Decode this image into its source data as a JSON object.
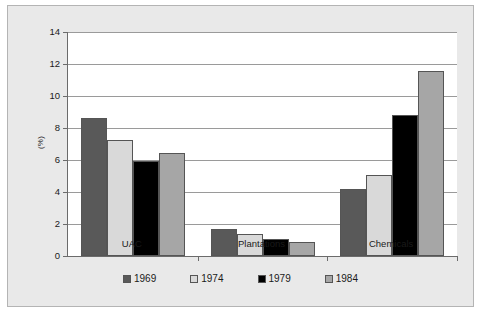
{
  "chart_data": {
    "type": "bar",
    "title": "",
    "xlabel": "",
    "ylabel": "(%)",
    "ylim": [
      0,
      14
    ],
    "yticks": [
      0,
      2,
      4,
      6,
      8,
      10,
      12,
      14
    ],
    "grid": true,
    "legend_position": "bottom",
    "categories": [
      "UAC",
      "Plantations",
      "Chemicals"
    ],
    "series": [
      {
        "name": "1969",
        "color": "#595959",
        "values": [
          8.6,
          1.7,
          4.2
        ]
      },
      {
        "name": "1974",
        "color": "#d9d9d9",
        "values": [
          7.25,
          1.35,
          5.05
        ]
      },
      {
        "name": "1979",
        "color": "#000000",
        "values": [
          5.95,
          1.05,
          8.8
        ]
      },
      {
        "name": "1984",
        "color": "#a6a6a6",
        "values": [
          6.45,
          0.9,
          11.55
        ]
      }
    ]
  },
  "axis": {
    "y_title": "(%)",
    "tick_labels": [
      "0",
      "2",
      "4",
      "6",
      "8",
      "10",
      "12",
      "14"
    ]
  },
  "legend": {
    "entries": [
      {
        "label": "1969",
        "color": "#595959"
      },
      {
        "label": "1974",
        "color": "#d9d9d9"
      },
      {
        "label": "1979",
        "color": "#000000"
      },
      {
        "label": "1984",
        "color": "#a6a6a6"
      }
    ]
  },
  "colors": {
    "figure_background": "#e9e9e9",
    "plot_background": "#ffffff",
    "frame_border": "#b4b4b4",
    "axis_line": "#6b6b6b",
    "gridline": "#9a9a9a",
    "text": "#1a1a1a"
  }
}
